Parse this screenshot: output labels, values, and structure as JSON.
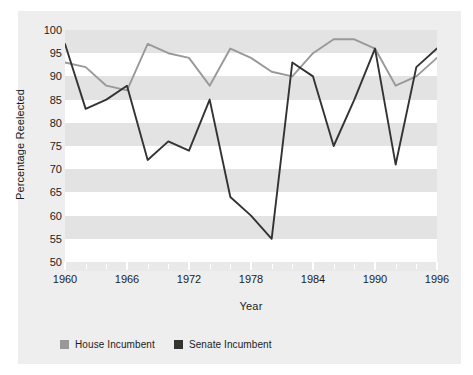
{
  "chart_data": {
    "type": "line",
    "title": "",
    "xlabel": "Year",
    "ylabel": "Percentage Reelected",
    "xlim": [
      1960,
      1996
    ],
    "ylim": [
      50,
      100
    ],
    "ytick_labels": [
      "100",
      "95",
      "90",
      "85",
      "80",
      "75",
      "70",
      "65",
      "60",
      "55",
      "50"
    ],
    "ytick_values": [
      100,
      95,
      90,
      85,
      80,
      75,
      70,
      65,
      60,
      55,
      50
    ],
    "xtick_labels": [
      "1960",
      "1966",
      "1972",
      "1978",
      "1984",
      "1990",
      "1996"
    ],
    "xtick_values": [
      1960,
      1966,
      1972,
      1978,
      1984,
      1990,
      1996
    ],
    "x": [
      1960,
      1962,
      1964,
      1966,
      1968,
      1970,
      1972,
      1974,
      1976,
      1978,
      1980,
      1982,
      1984,
      1986,
      1988,
      1990,
      1992,
      1994,
      1996
    ],
    "grid": "horizontal-bands",
    "legend_position": "bottom-left",
    "series": [
      {
        "name": "House Incumbent",
        "color": "#999999",
        "values": [
          93,
          92,
          88,
          87,
          97,
          95,
          94,
          88,
          96,
          94,
          91,
          90,
          95,
          98,
          98,
          96,
          88,
          90,
          94
        ]
      },
      {
        "name": "Senate Incumbent",
        "color": "#333333",
        "values": [
          97,
          83,
          85,
          88,
          72,
          76,
          74,
          85,
          64,
          60,
          55,
          93,
          90,
          75,
          85,
          96,
          71,
          92,
          96
        ]
      }
    ]
  },
  "legend": {
    "items": [
      {
        "label": "House Incumbent",
        "color": "#999999"
      },
      {
        "label": "Senate Incumbent",
        "color": "#333333"
      }
    ]
  },
  "axes": {
    "y_title": "Percentage Reelected",
    "x_title": "Year"
  }
}
